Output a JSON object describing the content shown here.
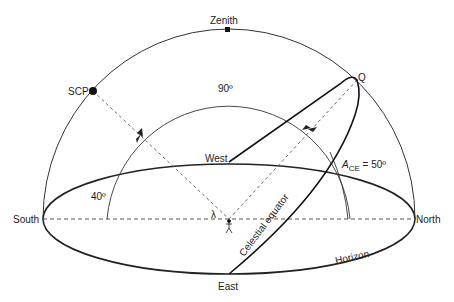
{
  "diagram": {
    "labels": {
      "zenith": "Zenith",
      "scp": "SCP",
      "q": "Q",
      "south": "South",
      "north": "North",
      "west": "West",
      "east": "East",
      "angle_90": "90º",
      "angle_40": "40º",
      "ace_a": "A",
      "ace_sub": "CE",
      "ace_value": " = 50º",
      "lambda": "λ",
      "celestial_equator": "Celestial equator",
      "horizon": "Horizon"
    },
    "colors": {
      "line": "#222222",
      "dashed": "#555555",
      "background": "#ffffff"
    }
  }
}
